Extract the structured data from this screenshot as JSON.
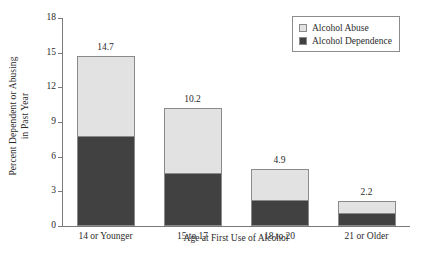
{
  "chart_data": {
    "type": "bar",
    "subtype": "stacked-vertical",
    "title": "",
    "xlabel": "Age at First Use of Alcohol",
    "ylabel": "Percent Dependent or Abusing in Past Year",
    "ylabel_lines": [
      "Percent Dependent or Abusing",
      "in Past Year"
    ],
    "categories": [
      "14 or Younger",
      "15 to 17",
      "18 to 20",
      "21 or Older"
    ],
    "series": [
      {
        "name": "Alcohol Dependence",
        "color": "#414141",
        "values": [
          7.8,
          4.6,
          2.2,
          1.1
        ]
      },
      {
        "name": "Alcohol Abuse",
        "color": "#e2e2e2",
        "values": [
          6.9,
          5.6,
          2.7,
          1.1
        ]
      }
    ],
    "stack_order_bottom_to_top": [
      "Alcohol Dependence",
      "Alcohol Abuse"
    ],
    "totals": [
      14.7,
      10.2,
      4.9,
      2.2
    ],
    "total_labels": [
      "14.7",
      "10.2",
      "4.9",
      "2.2"
    ],
    "ylim": [
      0,
      18
    ],
    "yticks": [
      0,
      3,
      6,
      9,
      12,
      15,
      18
    ],
    "ytick_labels": [
      "0",
      "3",
      "6",
      "9",
      "12",
      "15",
      "18"
    ],
    "grid": false,
    "legend_position": "top-right",
    "legend_entries": [
      {
        "label": "Alcohol Abuse",
        "color": "#e2e2e2"
      },
      {
        "label": "Alcohol Dependence",
        "color": "#414141"
      }
    ],
    "axis_color": "#7a7a7a",
    "bar_outline_color": "#8a8a8a"
  }
}
